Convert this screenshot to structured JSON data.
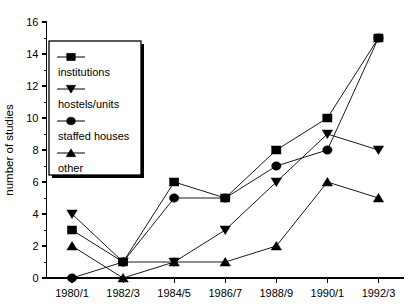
{
  "chart_data": {
    "type": "line",
    "title": "",
    "xlabel": "",
    "ylabel": "number of studies",
    "categories": [
      "1980/1",
      "1982/3",
      "1984/5",
      "1986/7",
      "1988/9",
      "1990/1",
      "1992/3"
    ],
    "ylim": [
      0,
      16
    ],
    "ytick_step": 2,
    "yticks": [
      "0",
      "2",
      "4",
      "6",
      "8",
      "10",
      "12",
      "14",
      "16"
    ],
    "minor_ticks": true,
    "grid": false,
    "legend_position": "upper-left-inside",
    "series": [
      {
        "name": "institutions",
        "marker": "square",
        "values": [
          3,
          1,
          6,
          5,
          8,
          10,
          15
        ]
      },
      {
        "name": "hostels/units",
        "marker": "triangle-down",
        "values": [
          4,
          1,
          1,
          3,
          6,
          9,
          8
        ]
      },
      {
        "name": "staffed houses",
        "marker": "circle",
        "values": [
          0,
          1,
          5,
          5,
          7,
          8,
          15
        ]
      },
      {
        "name": "other",
        "marker": "triangle-up",
        "values": [
          2,
          0,
          1,
          1,
          2,
          6,
          5
        ]
      }
    ]
  },
  "legend": {
    "entries": [
      {
        "label": "institutions",
        "marker": "square"
      },
      {
        "label": "hostels/units",
        "marker": "triangle-down"
      },
      {
        "label": "staffed houses",
        "marker": "circle"
      },
      {
        "label": "other",
        "marker": "triangle-up"
      }
    ]
  },
  "colors": {
    "ink": "#000000",
    "background": "#ffffff",
    "line": "#1a1a1a"
  }
}
